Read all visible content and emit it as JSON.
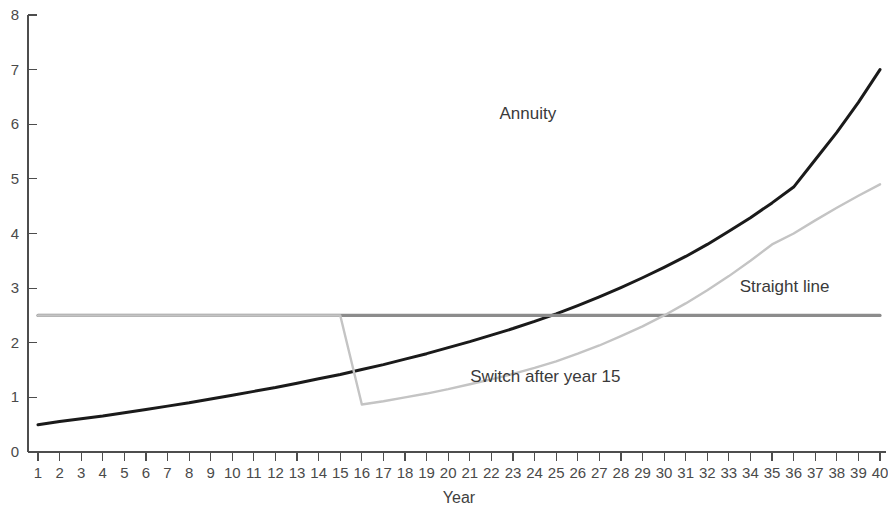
{
  "chart_data": {
    "type": "line",
    "title": "",
    "xlabel": "Year",
    "ylabel": "",
    "xlim": [
      1,
      40
    ],
    "ylim": [
      0,
      8
    ],
    "grid": false,
    "legend": "inline-annotations",
    "x_ticks": [
      1,
      2,
      3,
      4,
      5,
      6,
      7,
      8,
      9,
      10,
      11,
      12,
      13,
      14,
      15,
      16,
      17,
      18,
      19,
      20,
      21,
      22,
      23,
      24,
      25,
      26,
      27,
      28,
      29,
      30,
      31,
      32,
      33,
      34,
      35,
      36,
      37,
      38,
      39,
      40
    ],
    "y_ticks": [
      0,
      1,
      2,
      3,
      4,
      5,
      6,
      7,
      8
    ],
    "x": [
      1,
      2,
      3,
      4,
      5,
      6,
      7,
      8,
      9,
      10,
      11,
      12,
      13,
      14,
      15,
      16,
      17,
      18,
      19,
      20,
      21,
      22,
      23,
      24,
      25,
      26,
      27,
      28,
      29,
      30,
      31,
      32,
      33,
      34,
      35,
      36,
      37,
      38,
      39,
      40
    ],
    "series": [
      {
        "name": "Annuity",
        "color": "#1a1a1a",
        "width": 3.0,
        "label_x": 25,
        "label_y": 6.1,
        "values": [
          0.5,
          0.56,
          0.61,
          0.66,
          0.72,
          0.78,
          0.84,
          0.9,
          0.97,
          1.04,
          1.11,
          1.18,
          1.26,
          1.34,
          1.42,
          1.51,
          1.6,
          1.7,
          1.8,
          1.91,
          2.02,
          2.14,
          2.26,
          2.39,
          2.53,
          2.68,
          2.84,
          3.01,
          3.19,
          3.38,
          3.58,
          3.8,
          4.04,
          4.29,
          4.56,
          4.85,
          5.35,
          5.85,
          6.4,
          7.0
        ]
      },
      {
        "name": "Straight line",
        "color": "#8c8c8c",
        "width": 3.2,
        "label_x": 33.5,
        "label_y": 2.93,
        "constant": 2.5,
        "values": [
          2.5,
          2.5,
          2.5,
          2.5,
          2.5,
          2.5,
          2.5,
          2.5,
          2.5,
          2.5,
          2.5,
          2.5,
          2.5,
          2.5,
          2.5,
          2.5,
          2.5,
          2.5,
          2.5,
          2.5,
          2.5,
          2.5,
          2.5,
          2.5,
          2.5,
          2.5,
          2.5,
          2.5,
          2.5,
          2.5,
          2.5,
          2.5,
          2.5,
          2.5,
          2.5,
          2.5,
          2.5,
          2.5,
          2.5,
          2.5
        ]
      },
      {
        "name": "Switch after year 15",
        "color": "#c4c4c4",
        "width": 2.4,
        "label_x": 24.5,
        "label_y": 1.28,
        "switch_year": 15,
        "values": [
          2.5,
          2.5,
          2.5,
          2.5,
          2.5,
          2.5,
          2.5,
          2.5,
          2.5,
          2.5,
          2.5,
          2.5,
          2.5,
          2.5,
          2.5,
          0.87,
          0.93,
          1.0,
          1.07,
          1.15,
          1.24,
          1.33,
          1.43,
          1.54,
          1.66,
          1.8,
          1.95,
          2.12,
          2.3,
          2.5,
          2.72,
          2.96,
          3.22,
          3.5,
          3.8,
          4.0,
          4.24,
          4.47,
          4.69,
          4.9
        ]
      }
    ]
  },
  "axes": {
    "x_axis_title": "Year"
  }
}
